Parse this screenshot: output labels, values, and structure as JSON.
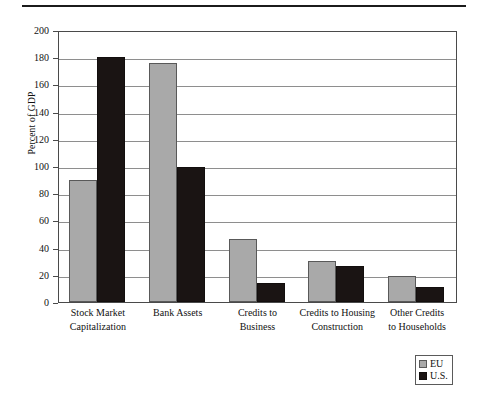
{
  "figure": {
    "top_rule": true,
    "legend_position": "bottom-right"
  },
  "chart_data": {
    "type": "bar",
    "title": "",
    "xlabel": "",
    "ylabel": "Percent of GDP",
    "ylim": [
      0,
      200
    ],
    "ytick_step": 20,
    "yticks": [
      0,
      20,
      40,
      60,
      80,
      100,
      120,
      140,
      160,
      180,
      200
    ],
    "ytick_labels": [
      "0",
      "20",
      "40",
      "60",
      "80",
      "100",
      "120",
      "140",
      "160",
      "180",
      "200"
    ],
    "grid": true,
    "grid_axis": "y",
    "legend": [
      "EU",
      "U.S."
    ],
    "colors": {
      "EU": "#a9a9a9",
      "U.S.": "#1a1413",
      "frame": "#4a4a4a",
      "grid": "#8e8e8e"
    },
    "categories": [
      "Stock Market Capitalization",
      "Bank Assets",
      "Credits to Business",
      "Credits to Housing Construction",
      "Other Credits to Households"
    ],
    "category_label_lines": [
      [
        "Stock Market",
        "Capitalization"
      ],
      [
        "Bank Assets",
        ""
      ],
      [
        "Credits to",
        "Business"
      ],
      [
        "Credits to Housing",
        "Construction"
      ],
      [
        "Other Credits",
        "to Households"
      ]
    ],
    "series": [
      {
        "name": "EU",
        "values": [
          90,
          176,
          46,
          30,
          19
        ]
      },
      {
        "name": "U.S.",
        "values": [
          180,
          99,
          14,
          26.5,
          11
        ]
      }
    ]
  },
  "axis": {
    "ylabel_text": "Percent of GDP"
  },
  "legend": {
    "items": [
      {
        "label": "EU",
        "swatch": "legend-swatch-eu"
      },
      {
        "label": "U.S.",
        "swatch": "legend-swatch-us"
      }
    ]
  }
}
